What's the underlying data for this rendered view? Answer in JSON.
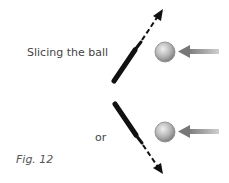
{
  "labels": {
    "slicing": "Slicing the ball",
    "or": "or",
    "figure": "Fig. 12"
  },
  "colors": {
    "bat": "#111111",
    "ball_light": "#e6e6e6",
    "ball_dark": "#8a8a8a",
    "incoming_arrow": "#8c8c8c",
    "text": "#444444"
  },
  "diagram": {
    "panels": [
      {
        "name": "top",
        "bat_direction": "up-right",
        "deflection": "upward"
      },
      {
        "name": "bottom",
        "bat_direction": "down-right",
        "deflection": "downward"
      }
    ]
  }
}
